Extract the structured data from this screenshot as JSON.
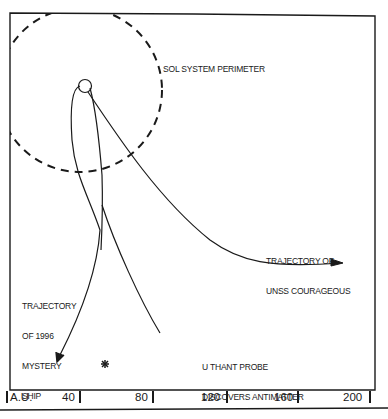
{
  "diagram": {
    "region_label": "SOL SYSTEM PERIMETER",
    "trajectories": [
      {
        "id": "unss",
        "label_lines": [
          "TRAJECTORY OF",
          "UNSS COURAGEOUS"
        ]
      },
      {
        "id": "mystery",
        "label_lines": [
          "TRAJECTORY",
          "OF 1996",
          "MYSTERY",
          "SHIP"
        ]
      },
      {
        "id": "uthant",
        "label_lines": [
          "U THANT PROBE",
          "DISCOVERS ANTIMATTER"
        ]
      }
    ],
    "event_marker": "asterisk",
    "axis": {
      "unit": "A.U.",
      "ticks": [
        "40",
        "80",
        "120",
        "160",
        "200"
      ]
    },
    "colors": {
      "ink": "#1a1a1a",
      "background": "#ffffff"
    }
  }
}
